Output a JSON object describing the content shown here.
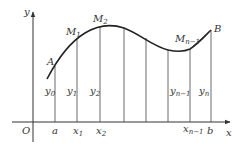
{
  "diagram": {
    "axes": {
      "x_label": "x",
      "y_label": "y",
      "origin_label": "O"
    },
    "x_ticks": [
      {
        "label": "a",
        "sub": ""
      },
      {
        "label": "x",
        "sub": "1"
      },
      {
        "label": "x",
        "sub": "2"
      },
      {
        "label": "x",
        "sub": "n−1"
      },
      {
        "label": "b",
        "sub": ""
      }
    ],
    "ordinates": [
      {
        "label": "y",
        "sub": "0"
      },
      {
        "label": "y",
        "sub": "1"
      },
      {
        "label": "y",
        "sub": "2"
      },
      {
        "label": "y",
        "sub": "n−1"
      },
      {
        "label": "y",
        "sub": "n"
      }
    ],
    "points": [
      {
        "label": "A",
        "sub": ""
      },
      {
        "label": "M",
        "sub": "1"
      },
      {
        "label": "M",
        "sub": "2"
      },
      {
        "label": "M",
        "sub": "n−1"
      },
      {
        "label": "B",
        "sub": ""
      }
    ],
    "colors": {
      "line": "#333333",
      "curve": "#222222",
      "background": "#ffffff"
    }
  }
}
